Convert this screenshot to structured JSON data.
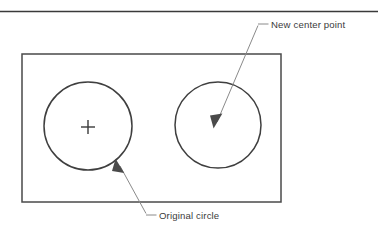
{
  "figure": {
    "background_color": "#ffffff",
    "separator_rule": {
      "name": "top-horizontal-rule",
      "y": 11,
      "x_start": 0,
      "x_end": 378,
      "color": "#3a3a3a"
    },
    "boundary_box": {
      "name": "drawing-boundary-rectangle",
      "x": 22,
      "y": 54,
      "width": 259,
      "height": 148,
      "stroke_color": "#4a4a4a"
    },
    "shapes": [
      {
        "name": "original-circle",
        "kind": "circle",
        "cx": 88,
        "cy": 126,
        "r": 44,
        "stroke_color": "#3f3f3f",
        "has_center_marker": true,
        "center_marker": "plus-cross"
      },
      {
        "name": "moved-circle",
        "kind": "circle",
        "cx": 218,
        "cy": 125,
        "r": 43,
        "stroke_color": "#3f3f3f",
        "has_center_marker": false,
        "center_marker": ""
      }
    ],
    "annotations": [
      {
        "name": "new-center-point-annotation",
        "label": "New center point",
        "text_x": 271,
        "text_y": 27,
        "tick_x1": 258,
        "tick_x2": 268,
        "tick_y": 24,
        "leader_x1": 258,
        "leader_y1": 26,
        "leader_x2": 216,
        "leader_y2": 124,
        "arrow_tip_x": 214,
        "arrow_tip_y": 128,
        "arrow_angle_deg": 113,
        "color": "#3b3b3b"
      },
      {
        "name": "original-circle-annotation",
        "label": "Original circle",
        "text_x": 159,
        "text_y": 218,
        "tick_x1": 146,
        "tick_x2": 156,
        "tick_y": 215,
        "leader_x1": 146,
        "leader_y1": 213,
        "leader_x2": 119,
        "leader_y2": 164,
        "arrow_tip_x": 116,
        "arrow_tip_y": 159,
        "arrow_angle_deg": 298,
        "color": "#3b3b3b"
      }
    ]
  }
}
